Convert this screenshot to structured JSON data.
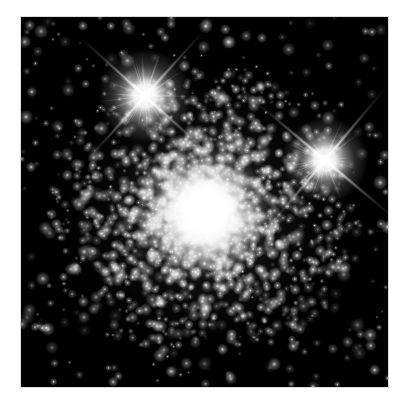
{
  "image": {
    "kind": "astronomical-photograph",
    "subject": "globular-star-cluster",
    "caption_visible": "",
    "background_color": "#000000",
    "border_color": "#ffffff",
    "plate": {
      "x": 21,
      "y": 17,
      "width": 367,
      "height": 370
    }
  },
  "chart_data": {
    "type": "scatter",
    "title": "",
    "subtitle": "",
    "xlabel": "",
    "ylabel": "",
    "grid": false,
    "legend": "none",
    "xlim": [
      0,
      367
    ],
    "ylim": [
      0,
      370
    ],
    "background": "#000000",
    "cluster": {
      "name": "globular-cluster-core",
      "center_x": 184,
      "center_y": 195,
      "core_radius": 26,
      "halo_radius": 150,
      "core_color": "#ffffff",
      "halo_color": "#d8d8d8",
      "star_count": 2600,
      "density_falloff": 2.1
    },
    "bright_stars": [
      {
        "name": "foreground-star-upper-left",
        "x": 124,
        "y": 79,
        "radius": 13,
        "spike_length": 86,
        "spike_angles_deg": [
          42,
          132,
          222,
          312
        ],
        "color": "#ffffff"
      },
      {
        "name": "foreground-star-right",
        "x": 304,
        "y": 143,
        "radius": 12,
        "spike_length": 92,
        "spike_angles_deg": [
          40,
          130,
          220,
          310
        ],
        "color": "#ffffff"
      }
    ],
    "field_stars": {
      "count": 420,
      "min_radius": 0.5,
      "max_radius": 2.4,
      "color": "#e8e8e8"
    }
  }
}
